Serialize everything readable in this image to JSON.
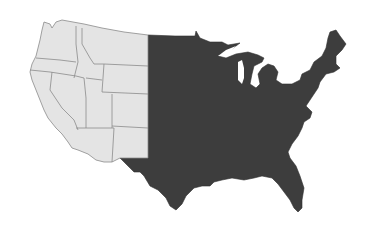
{
  "map": {
    "subject": "Contiguous United States",
    "style": "grayscale choropleth",
    "regions": [
      {
        "name": "Western states",
        "fill": "#e4e4e4",
        "states": [
          "Washington",
          "Oregon",
          "California",
          "Idaho",
          "Nevada",
          "Montana",
          "Wyoming",
          "Utah",
          "Colorado",
          "Arizona",
          "New Mexico"
        ]
      },
      {
        "name": "Eastern states",
        "fill": "#3d3d3d",
        "states": [
          "North Dakota",
          "South Dakota",
          "Nebraska",
          "Kansas",
          "Oklahoma",
          "Texas",
          "Minnesota",
          "Iowa",
          "Missouri",
          "Arkansas",
          "Louisiana",
          "Wisconsin",
          "Illinois",
          "Michigan",
          "Indiana",
          "Ohio",
          "Kentucky",
          "Tennessee",
          "Mississippi",
          "Alabama",
          "Georgia",
          "Florida",
          "South Carolina",
          "North Carolina",
          "Virginia",
          "West Virginia",
          "Maryland",
          "Delaware",
          "Pennsylvania",
          "New Jersey",
          "New York",
          "Connecticut",
          "Rhode Island",
          "Massachusetts",
          "Vermont",
          "New Hampshire",
          "Maine"
        ]
      }
    ],
    "labels": []
  }
}
